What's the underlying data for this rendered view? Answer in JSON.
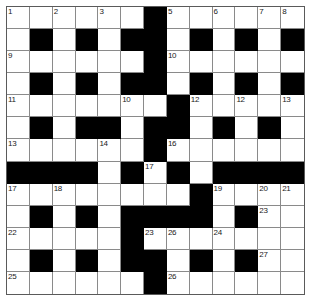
{
  "puzzle": {
    "kind": "crossword-grid",
    "rows": 13,
    "cols": 13,
    "colors": {
      "block": "#000000",
      "cell": "#ffffff",
      "cell_border": "#8a8a8a",
      "frame_border": "#5a5a5a",
      "number_text": "#1a1a1a",
      "page_background": "#ffffff"
    },
    "grid": [
      [
        "w",
        "w",
        "w",
        "w",
        "w",
        "w",
        "b",
        "w",
        "w",
        "w",
        "w",
        "w",
        "w"
      ],
      [
        "w",
        "b",
        "w",
        "b",
        "w",
        "b",
        "b",
        "w",
        "b",
        "w",
        "b",
        "w",
        "b"
      ],
      [
        "w",
        "w",
        "w",
        "w",
        "w",
        "w",
        "b",
        "w",
        "w",
        "w",
        "w",
        "w",
        "w"
      ],
      [
        "w",
        "b",
        "w",
        "b",
        "w",
        "b",
        "b",
        "w",
        "b",
        "w",
        "b",
        "w",
        "b"
      ],
      [
        "w",
        "w",
        "w",
        "w",
        "w",
        "w",
        "w",
        "b",
        "w",
        "w",
        "w",
        "w",
        "w"
      ],
      [
        "w",
        "b",
        "w",
        "b",
        "b",
        "w",
        "b",
        "b",
        "w",
        "b",
        "w",
        "b",
        "w"
      ],
      [
        "w",
        "w",
        "w",
        "w",
        "w",
        "w",
        "b",
        "w",
        "w",
        "w",
        "w",
        "w",
        "w"
      ],
      [
        "b",
        "b",
        "b",
        "b",
        "w",
        "b",
        "w",
        "b",
        "w",
        "b",
        "b",
        "b",
        "b"
      ],
      [
        "w",
        "w",
        "w",
        "w",
        "w",
        "w",
        "w",
        "w",
        "b",
        "w",
        "w",
        "w",
        "w"
      ],
      [
        "w",
        "b",
        "w",
        "b",
        "w",
        "b",
        "b",
        "b",
        "b",
        "w",
        "b",
        "w",
        "w"
      ],
      [
        "w",
        "w",
        "w",
        "w",
        "w",
        "b",
        "w",
        "w",
        "w",
        "w",
        "w",
        "w",
        "w"
      ],
      [
        "w",
        "b",
        "w",
        "b",
        "w",
        "b",
        "b",
        "w",
        "b",
        "w",
        "b",
        "w",
        "w"
      ],
      [
        "w",
        "w",
        "w",
        "w",
        "w",
        "w",
        "b",
        "w",
        "w",
        "w",
        "w",
        "w",
        "w"
      ]
    ],
    "numbers": {
      "0-0": "1",
      "0-2": "2",
      "0-4": "3",
      "0-6": "4",
      "0-7": "5",
      "0-9": "6",
      "0-11": "7",
      "0-12": "8",
      "2-0": "9",
      "2-7": "10",
      "4-0": "11",
      "4-8": "12",
      "6-0": "13",
      "6-4": "14",
      "6-6": "15",
      "6-7": "16",
      "8-0": "17",
      "8-2": "18",
      "8-9": "19",
      "8-11": "20",
      "8-12": "21",
      "10-0": "22",
      "10-6": "23",
      "10-9": "24",
      "12-0": "25",
      "12-7": "26",
      "12-12": ""
    },
    "number_labels_flat": [
      "1",
      "2",
      "3",
      "4",
      "5",
      "6",
      "7",
      "8",
      "9",
      "10",
      "11",
      "12",
      "13",
      "14",
      "15",
      "16",
      "17",
      "18",
      "19",
      "20",
      "21",
      "22",
      "23",
      "24",
      "25",
      "26",
      "27",
      "28"
    ]
  }
}
